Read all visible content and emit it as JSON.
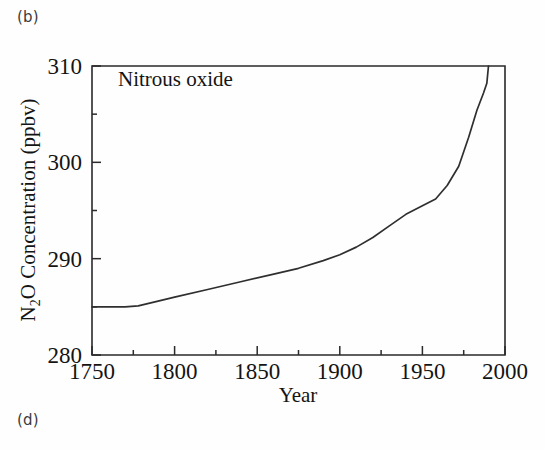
{
  "panels": {
    "top_label": "(b)",
    "bottom_label": "(d)"
  },
  "chart_data": {
    "type": "line",
    "title": "",
    "annotation": "Nitrous oxide",
    "xlabel": "Year",
    "ylabel_main": "O Concentration (ppbv)",
    "ylabel_prefix": "N",
    "ylabel_subscript": "2",
    "ylabel_full": "N2O Concentration (ppbv)",
    "xlim": [
      1750,
      2000
    ],
    "ylim": [
      280,
      310
    ],
    "x_major_ticks": [
      1750,
      1800,
      1850,
      1900,
      1950,
      2000
    ],
    "x_major_tick_labels": [
      "1750",
      "1800",
      "1850",
      "1900",
      "1950",
      "2000"
    ],
    "x_minor_ticks": [
      1775,
      1825,
      1875,
      1925,
      1975
    ],
    "y_major_ticks": [
      280,
      290,
      300,
      310
    ],
    "y_major_tick_labels": [
      "280",
      "290",
      "300",
      "310"
    ],
    "y_minor_ticks": [
      285,
      295,
      305
    ],
    "grid": false,
    "legend": false,
    "line_color": "#2f2f2f",
    "axis_color": "#2a2a2a",
    "background_color": "#fefefe",
    "series": [
      {
        "name": "Nitrous oxide",
        "units": "ppbv",
        "x": [
          1750,
          1760,
          1770,
          1778,
          1790,
          1800,
          1820,
          1840,
          1860,
          1875,
          1890,
          1900,
          1910,
          1920,
          1930,
          1940,
          1950,
          1958,
          1965,
          1972,
          1978,
          1983,
          1987,
          1989,
          1990
        ],
        "values": [
          285.0,
          285.0,
          285.0,
          285.1,
          285.6,
          286.0,
          286.8,
          287.6,
          288.4,
          289.0,
          289.8,
          290.4,
          291.2,
          292.2,
          293.4,
          294.6,
          295.5,
          296.2,
          297.6,
          299.6,
          302.6,
          305.4,
          307.2,
          308.2,
          310.0
        ]
      }
    ]
  }
}
